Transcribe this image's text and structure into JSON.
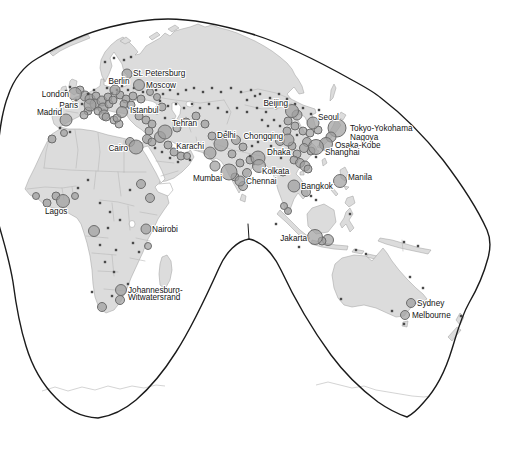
{
  "figure": {
    "kind": "world-map-figure",
    "visible_region": "Europe, Africa, Asia and Australia on an interrupted (Goode-type) projection with graduated city symbols"
  },
  "colors": {
    "ocean": "#ffffff",
    "land": "#dcdcdc",
    "coastline": "#a3a3a3",
    "country_border": "#b9b9b9",
    "projection_outline": "#1b1b1b",
    "city_symbol_fill": "#a0a0a0",
    "city_symbol_stroke": "#6d6d6d",
    "town_dot": "#4a4a4a",
    "label_text": "#141414"
  },
  "map": {
    "labeled_cities": [
      {
        "name": "London",
        "x": 75,
        "y": 94,
        "r": 6.5,
        "label": {
          "x": 69,
          "y": 97,
          "anchor": "end",
          "lines": [
            "London"
          ]
        }
      },
      {
        "name": "Paris",
        "x": 90,
        "y": 105,
        "r": 6,
        "label": {
          "x": 78,
          "y": 108,
          "anchor": "end",
          "lines": [
            "Paris"
          ]
        }
      },
      {
        "name": "Madrid",
        "x": 66,
        "y": 120,
        "r": 6,
        "label": {
          "x": 62,
          "y": 115,
          "anchor": "end",
          "lines": [
            "Madrid"
          ]
        }
      },
      {
        "name": "Berlin",
        "x": 115,
        "y": 90,
        "r": 5,
        "label": {
          "x": 119,
          "y": 84,
          "anchor": "middle",
          "lines": [
            "Berlin"
          ]
        }
      },
      {
        "name": "St. Petersburg",
        "x": 127,
        "y": 74,
        "r": 5,
        "label": {
          "x": 133,
          "y": 76,
          "anchor": "start",
          "lines": [
            "St. Petersburg"
          ]
        }
      },
      {
        "name": "Moscow",
        "x": 139,
        "y": 85,
        "r": 5.5,
        "label": {
          "x": 146,
          "y": 88,
          "anchor": "start",
          "lines": [
            "Moscow"
          ]
        }
      },
      {
        "name": "Istanbul",
        "x": 122,
        "y": 112,
        "r": 5.5,
        "label": {
          "x": 130,
          "y": 113,
          "anchor": "start",
          "lines": [
            "Istanbul"
          ]
        }
      },
      {
        "name": "Tehran",
        "x": 165,
        "y": 132,
        "r": 7,
        "label": {
          "x": 172,
          "y": 126,
          "anchor": "start",
          "lines": [
            "Tehran"
          ]
        }
      },
      {
        "name": "Cairo",
        "x": 136,
        "y": 147,
        "r": 7,
        "label": {
          "x": 128,
          "y": 151,
          "anchor": "end",
          "lines": [
            "Cairo"
          ]
        }
      },
      {
        "name": "Karachi",
        "x": 210,
        "y": 153,
        "r": 6,
        "label": {
          "x": 204,
          "y": 149,
          "anchor": "end",
          "lines": [
            "Karachi"
          ]
        }
      },
      {
        "name": "Delhi",
        "x": 221,
        "y": 144,
        "r": 7,
        "label": {
          "x": 217,
          "y": 138,
          "anchor": "start",
          "lines": [
            "Delhi"
          ]
        }
      },
      {
        "name": "Chongqing",
        "x": 288,
        "y": 140,
        "r": 6,
        "label": {
          "x": 283,
          "y": 139,
          "anchor": "end",
          "lines": [
            "Chongqing"
          ]
        }
      },
      {
        "name": "Mumbai",
        "x": 229,
        "y": 172,
        "r": 8,
        "label": {
          "x": 222,
          "y": 181,
          "anchor": "end",
          "lines": [
            "Mumbai"
          ]
        }
      },
      {
        "name": "Chennai",
        "x": 240,
        "y": 181,
        "r": 5,
        "label": {
          "x": 246,
          "y": 184,
          "anchor": "start",
          "lines": [
            "Chennai"
          ]
        }
      },
      {
        "name": "Dhaka",
        "x": 258,
        "y": 158,
        "r": 7,
        "label": {
          "x": 267,
          "y": 155,
          "anchor": "start",
          "lines": [
            "Dhaka"
          ]
        }
      },
      {
        "name": "Kolkata",
        "x": 259,
        "y": 166,
        "r": 6.5,
        "label": {
          "x": 262,
          "y": 174,
          "anchor": "start",
          "lines": [
            "Kolkata"
          ]
        }
      },
      {
        "name": "Beijing",
        "x": 292,
        "y": 111,
        "r": 6.5,
        "label": {
          "x": 288,
          "y": 106,
          "anchor": "end",
          "lines": [
            "Beijing"
          ]
        }
      },
      {
        "name": "Seoul",
        "x": 313,
        "y": 123,
        "r": 6,
        "label": {
          "x": 318,
          "y": 120,
          "anchor": "start",
          "lines": [
            "Seoul"
          ]
        }
      },
      {
        "name": "Tokyo-Yokohama",
        "x": 337,
        "y": 128,
        "r": 9,
        "label": {
          "x": 350,
          "y": 131,
          "anchor": "start",
          "lines": [
            "Tokyo-Yokohama"
          ]
        }
      },
      {
        "name": "Nagoya",
        "x": 331,
        "y": 137,
        "r": 5,
        "label": {
          "x": 350,
          "y": 140,
          "anchor": "start",
          "lines": [
            "Nagoya"
          ]
        }
      },
      {
        "name": "Osaka-Kobe",
        "x": 326,
        "y": 144,
        "r": 6.5,
        "label": {
          "x": 335,
          "y": 148,
          "anchor": "start",
          "lines": [
            "Osaka-Kobe"
          ]
        }
      },
      {
        "name": "Shanghai",
        "x": 316,
        "y": 147,
        "r": 7.5,
        "label": {
          "x": 325,
          "y": 155,
          "anchor": "start",
          "lines": [
            "Shanghai"
          ]
        }
      },
      {
        "name": "Bangkok",
        "x": 294,
        "y": 186,
        "r": 6,
        "label": {
          "x": 301,
          "y": 189,
          "anchor": "start",
          "lines": [
            "Bangkok"
          ]
        }
      },
      {
        "name": "Manila",
        "x": 340,
        "y": 181,
        "r": 6.5,
        "label": {
          "x": 348,
          "y": 180,
          "anchor": "start",
          "lines": [
            "Manila"
          ]
        }
      },
      {
        "name": "Jakarta",
        "x": 315,
        "y": 237,
        "r": 7.5,
        "label": {
          "x": 307,
          "y": 241,
          "anchor": "end",
          "lines": [
            "Jakarta"
          ]
        }
      },
      {
        "name": "Nairobi",
        "x": 146,
        "y": 229,
        "r": 5,
        "label": {
          "x": 152,
          "y": 232,
          "anchor": "start",
          "lines": [
            "Nairobi"
          ]
        }
      },
      {
        "name": "Lagos",
        "x": 63,
        "y": 201,
        "r": 6.5,
        "label": {
          "x": 45,
          "y": 214,
          "anchor": "start",
          "lines": [
            "Lagos"
          ]
        }
      },
      {
        "name": "Johannesburg-Witwatersrand",
        "x": 121,
        "y": 290,
        "r": 5.5,
        "label": {
          "x": 128,
          "y": 293,
          "anchor": "start",
          "lines": [
            "Johannesburg-",
            "Witwatersrand"
          ]
        }
      },
      {
        "name": "Sydney",
        "x": 411,
        "y": 303,
        "r": 4.5,
        "label": {
          "x": 417,
          "y": 306,
          "anchor": "start",
          "lines": [
            "Sydney"
          ]
        }
      },
      {
        "name": "Melbourne",
        "x": 405,
        "y": 315,
        "r": 4.5,
        "label": {
          "x": 412,
          "y": 318,
          "anchor": "start",
          "lines": [
            "Melbourne"
          ]
        }
      }
    ],
    "unlabeled_cities": [
      [
        80,
        90,
        4
      ],
      [
        85,
        96,
        5
      ],
      [
        90,
        99,
        5
      ],
      [
        96,
        96,
        4
      ],
      [
        95,
        104,
        5
      ],
      [
        102,
        101,
        5
      ],
      [
        108,
        97,
        4
      ],
      [
        103,
        108,
        5
      ],
      [
        109,
        104,
        4
      ],
      [
        113,
        100,
        4
      ],
      [
        98,
        111,
        4
      ],
      [
        104,
        115,
        5
      ],
      [
        106,
        117,
        4
      ],
      [
        114,
        120,
        4
      ],
      [
        119,
        124,
        4
      ],
      [
        88,
        111,
        4
      ],
      [
        84,
        115,
        4
      ],
      [
        117,
        118,
        4
      ],
      [
        120,
        95,
        4
      ],
      [
        126,
        99,
        4
      ],
      [
        133,
        96,
        4
      ],
      [
        141,
        99,
        4
      ],
      [
        150,
        92,
        3.5
      ],
      [
        157,
        97,
        3.5
      ],
      [
        124,
        104,
        4
      ],
      [
        131,
        105,
        4
      ],
      [
        139,
        116,
        4
      ],
      [
        146,
        120,
        4
      ],
      [
        152,
        124,
        4
      ],
      [
        149,
        131,
        4
      ],
      [
        147,
        139,
        4.5
      ],
      [
        152,
        142,
        4
      ],
      [
        160,
        137,
        5.5
      ],
      [
        168,
        145,
        4
      ],
      [
        174,
        152,
        4
      ],
      [
        181,
        156,
        4
      ],
      [
        187,
        156,
        3.5
      ],
      [
        177,
        128,
        4
      ],
      [
        186,
        122,
        4
      ],
      [
        196,
        116,
        4
      ],
      [
        205,
        124,
        4
      ],
      [
        212,
        136,
        4
      ],
      [
        162,
        107,
        4
      ],
      [
        130,
        142,
        4.5
      ],
      [
        141,
        184,
        4.5
      ],
      [
        150,
        198,
        4.5
      ],
      [
        56,
        196,
        4
      ],
      [
        47,
        203,
        4
      ],
      [
        36,
        196,
        3.5
      ],
      [
        75,
        196,
        3.5
      ],
      [
        94,
        231,
        5.5
      ],
      [
        148,
        246,
        3.5
      ],
      [
        52,
        139,
        4
      ],
      [
        64,
        133,
        3.5
      ],
      [
        120,
        300,
        4.5
      ],
      [
        102,
        307,
        4.5
      ],
      [
        215,
        166,
        5
      ],
      [
        236,
        140,
        4.5
      ],
      [
        243,
        147,
        4
      ],
      [
        232,
        154,
        4
      ],
      [
        240,
        163,
        4
      ],
      [
        247,
        173,
        4.5
      ],
      [
        235,
        177,
        4
      ],
      [
        243,
        186,
        4.5
      ],
      [
        250,
        160,
        4
      ],
      [
        297,
        115,
        5
      ],
      [
        288,
        121,
        4
      ],
      [
        295,
        126,
        4
      ],
      [
        303,
        131,
        4
      ],
      [
        310,
        133,
        4
      ],
      [
        307,
        142,
        4.5
      ],
      [
        311,
        151,
        4
      ],
      [
        304,
        148,
        4.5
      ],
      [
        297,
        154,
        4
      ],
      [
        294,
        160,
        4
      ],
      [
        300,
        163,
        4.5
      ],
      [
        305,
        166,
        5
      ],
      [
        308,
        169,
        4
      ],
      [
        280,
        141,
        4.5
      ],
      [
        287,
        131,
        4
      ],
      [
        292,
        146,
        4
      ],
      [
        318,
        130,
        4
      ],
      [
        283,
        172,
        4
      ],
      [
        306,
        192,
        4.5
      ],
      [
        288,
        211,
        3.5
      ],
      [
        284,
        206,
        3.5
      ],
      [
        328,
        240,
        5.5
      ],
      [
        322,
        241,
        4
      ]
    ],
    "small_towns": [
      [
        70,
        87
      ],
      [
        66,
        91
      ],
      [
        76,
        100
      ],
      [
        82,
        104
      ],
      [
        88,
        94
      ],
      [
        94,
        90
      ],
      [
        107,
        88
      ],
      [
        112,
        93
      ],
      [
        117,
        90
      ],
      [
        122,
        86
      ],
      [
        128,
        90
      ],
      [
        134,
        88
      ],
      [
        143,
        92
      ],
      [
        149,
        86
      ],
      [
        156,
        90
      ],
      [
        163,
        94
      ],
      [
        170,
        90
      ],
      [
        178,
        94
      ],
      [
        186,
        90
      ],
      [
        194,
        88
      ],
      [
        203,
        92
      ],
      [
        212,
        88
      ],
      [
        221,
        92
      ],
      [
        231,
        88
      ],
      [
        241,
        92
      ],
      [
        251,
        90
      ],
      [
        260,
        94
      ],
      [
        270,
        98
      ],
      [
        279,
        94
      ],
      [
        287,
        99
      ],
      [
        160,
        101
      ],
      [
        168,
        106
      ],
      [
        176,
        104
      ],
      [
        184,
        108
      ],
      [
        192,
        104
      ],
      [
        200,
        108
      ],
      [
        209,
        104
      ],
      [
        218,
        108
      ],
      [
        227,
        112
      ],
      [
        237,
        108
      ],
      [
        247,
        112
      ],
      [
        257,
        108
      ],
      [
        266,
        112
      ],
      [
        276,
        108
      ],
      [
        157,
        113
      ],
      [
        165,
        118
      ],
      [
        173,
        120
      ],
      [
        247,
        100
      ],
      [
        255,
        96
      ],
      [
        105,
        62
      ],
      [
        114,
        58
      ],
      [
        124,
        60
      ],
      [
        131,
        57
      ],
      [
        155,
        148
      ],
      [
        162,
        152
      ],
      [
        170,
        158
      ],
      [
        178,
        162
      ],
      [
        190,
        160
      ],
      [
        199,
        144
      ],
      [
        60,
        128
      ],
      [
        70,
        132
      ],
      [
        88,
        180
      ],
      [
        78,
        188
      ],
      [
        100,
        203
      ],
      [
        110,
        212
      ],
      [
        120,
        220
      ],
      [
        108,
        228
      ],
      [
        100,
        245
      ],
      [
        116,
        250
      ],
      [
        105,
        262
      ],
      [
        114,
        272
      ],
      [
        133,
        243
      ],
      [
        139,
        252
      ],
      [
        92,
        292
      ],
      [
        112,
        296
      ],
      [
        128,
        284
      ],
      [
        130,
        190
      ],
      [
        226,
        132
      ],
      [
        233,
        136
      ],
      [
        250,
        156
      ],
      [
        254,
        164
      ],
      [
        262,
        180
      ],
      [
        262,
        120
      ],
      [
        268,
        126
      ],
      [
        274,
        120
      ],
      [
        280,
        126
      ],
      [
        287,
        108
      ],
      [
        295,
        104
      ],
      [
        303,
        108
      ],
      [
        311,
        114
      ],
      [
        319,
        110
      ],
      [
        297,
        135
      ],
      [
        289,
        152
      ],
      [
        281,
        158
      ],
      [
        271,
        146
      ],
      [
        265,
        138
      ],
      [
        258,
        142
      ],
      [
        252,
        146
      ],
      [
        316,
        157
      ],
      [
        311,
        196
      ],
      [
        316,
        200
      ],
      [
        350,
        214
      ],
      [
        276,
        224
      ],
      [
        299,
        247
      ],
      [
        356,
        250
      ],
      [
        366,
        254
      ],
      [
        404,
        242
      ],
      [
        418,
        246
      ],
      [
        341,
        299
      ],
      [
        392,
        311
      ],
      [
        423,
        288
      ],
      [
        410,
        277
      ],
      [
        461,
        316
      ],
      [
        404,
        324
      ]
    ]
  }
}
